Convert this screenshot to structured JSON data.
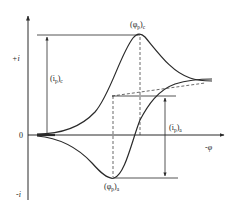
{
  "diagram": {
    "type": "cyclic-voltammogram",
    "axes": {
      "y_positive_label": "+i",
      "y_negative_label": "-i",
      "origin_label": "0",
      "x_label": "-φ"
    },
    "annotations": {
      "cathodic_peak_potential": {
        "main": "(φ",
        "sub": "p",
        "close": ")",
        "sub2": "c"
      },
      "anodic_peak_potential": {
        "main": "(φ",
        "sub": "p",
        "close": ")",
        "sub2": "a"
      },
      "cathodic_peak_current": {
        "main": "(i",
        "sub": "p",
        "close": ")",
        "sub2": "c"
      },
      "anodic_peak_current": {
        "main": "(i",
        "sub": "p",
        "close": ")",
        "sub2": "a"
      }
    },
    "colors": {
      "line": "#2a2a2a",
      "background": "#ffffff"
    }
  }
}
